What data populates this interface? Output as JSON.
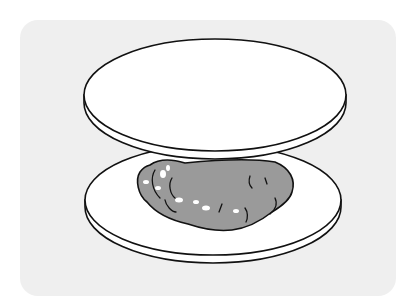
{
  "illustration": {
    "subject": "Two round discs with a lumpy gray filling between them",
    "colors": {
      "page_background": "#ffffff",
      "backdrop": "#efefef",
      "disc_fill": "#ffffff",
      "outline": "#111111",
      "filling": "#9a9a9a",
      "highlight": "#ffffff"
    },
    "elements": [
      "top-disc",
      "bottom-disc",
      "filling"
    ]
  }
}
